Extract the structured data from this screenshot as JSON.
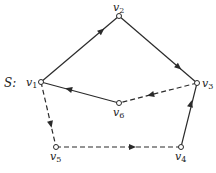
{
  "graph": {
    "name": "S",
    "name_label": "S:",
    "nodes": [
      {
        "id": "v1",
        "label": "v",
        "sub": "1",
        "x": 41,
        "y": 82,
        "lx": 26,
        "ly": 86
      },
      {
        "id": "v2",
        "label": "v",
        "sub": "2",
        "x": 119,
        "y": 16,
        "lx": 113,
        "ly": 10
      },
      {
        "id": "v3",
        "label": "v",
        "sub": "3",
        "x": 197,
        "y": 83,
        "lx": 202,
        "ly": 87
      },
      {
        "id": "v4",
        "label": "v",
        "sub": "4",
        "x": 181,
        "y": 147,
        "lx": 175,
        "ly": 161
      },
      {
        "id": "v5",
        "label": "v",
        "sub": "5",
        "x": 56,
        "y": 147,
        "lx": 50,
        "ly": 161
      },
      {
        "id": "v6",
        "label": "v",
        "sub": "6",
        "x": 119,
        "y": 103,
        "lx": 113,
        "ly": 117
      }
    ],
    "edges": [
      {
        "from": "v1",
        "to": "v2",
        "style": "solid"
      },
      {
        "from": "v2",
        "to": "v3",
        "style": "solid"
      },
      {
        "from": "v3",
        "to": "v6",
        "style": "dashed"
      },
      {
        "from": "v6",
        "to": "v1",
        "style": "solid"
      },
      {
        "from": "v1",
        "to": "v5",
        "style": "dashed"
      },
      {
        "from": "v5",
        "to": "v4",
        "style": "dashed"
      },
      {
        "from": "v4",
        "to": "v3",
        "style": "solid"
      }
    ]
  }
}
